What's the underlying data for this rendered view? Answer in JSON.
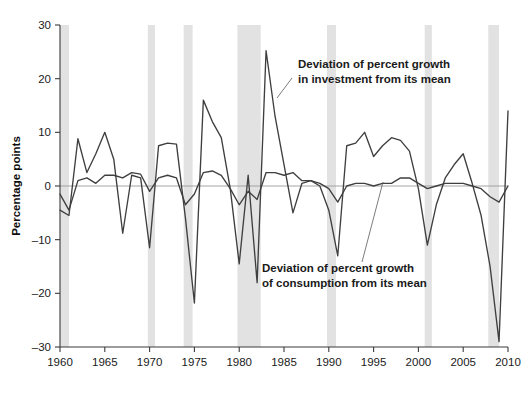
{
  "chart_data": {
    "type": "line",
    "title": "",
    "xlabel": "",
    "ylabel": "Percentage points",
    "xlim": [
      1960,
      2010
    ],
    "ylim": [
      -30,
      30
    ],
    "grid": false,
    "legend_position": "annotations-inline",
    "x_ticks": [
      1960,
      1965,
      1970,
      1975,
      1980,
      1985,
      1990,
      1995,
      2000,
      2005,
      2010
    ],
    "y_ticks": [
      -30,
      -20,
      -10,
      0,
      10,
      20,
      30
    ],
    "zero_line": 0,
    "x": [
      1960,
      1961,
      1962,
      1963,
      1964,
      1965,
      1966,
      1967,
      1968,
      1969,
      1970,
      1971,
      1972,
      1973,
      1974,
      1975,
      1976,
      1977,
      1978,
      1979,
      1980,
      1981,
      1982,
      1983,
      1984,
      1985,
      1986,
      1987,
      1988,
      1989,
      1990,
      1991,
      1992,
      1993,
      1994,
      1995,
      1996,
      1997,
      1998,
      1999,
      2000,
      2001,
      2002,
      2003,
      2004,
      2005,
      2006,
      2007,
      2008,
      2009,
      2010
    ],
    "series": [
      {
        "name": "Deviation of percent growth in investment from its mean",
        "values": [
          -4.5,
          -5.5,
          8.8,
          2.5,
          6.0,
          10.0,
          5.0,
          -8.8,
          2.0,
          1.5,
          -11.5,
          7.5,
          8.0,
          7.8,
          -6.0,
          -21.8,
          16.0,
          12.0,
          9.0,
          -0.5,
          -14.5,
          2.0,
          -18.0,
          25.2,
          13.0,
          4.0,
          -5.0,
          0.5,
          1.0,
          0.0,
          -4.5,
          -13.0,
          7.5,
          8.0,
          10.0,
          5.5,
          7.5,
          9.0,
          8.5,
          6.5,
          -0.5,
          -11.0,
          -3.5,
          1.5,
          4.0,
          6.0,
          0.5,
          -5.5,
          -15.0,
          -29.0,
          14.0
        ]
      },
      {
        "name": "Deviation of percent growth of consumption from its mean",
        "values": [
          -1.5,
          -4.5,
          1.0,
          1.5,
          0.5,
          2.0,
          2.0,
          1.5,
          2.5,
          2.2,
          -1.0,
          1.5,
          2.0,
          1.5,
          -3.5,
          -1.5,
          2.5,
          2.8,
          2.0,
          -0.5,
          -3.5,
          -1.0,
          -2.5,
          2.5,
          2.5,
          2.0,
          2.5,
          1.0,
          1.0,
          0.5,
          -0.5,
          -3.0,
          0.0,
          0.5,
          0.5,
          0.0,
          0.5,
          0.5,
          1.5,
          1.5,
          0.5,
          -0.5,
          0.0,
          0.5,
          0.5,
          0.5,
          0.0,
          -0.5,
          -2.0,
          -3.0,
          0.0
        ]
      }
    ],
    "shaded_bands": [
      {
        "name": "recession-1960",
        "start": 1960.0,
        "end": 1961.0
      },
      {
        "name": "recession-1970",
        "start": 1969.8,
        "end": 1970.6
      },
      {
        "name": "recession-1974",
        "start": 1973.8,
        "end": 1974.8
      },
      {
        "name": "recession-1980-82",
        "start": 1979.8,
        "end": 1982.4
      },
      {
        "name": "recession-1990",
        "start": 1989.8,
        "end": 1990.8
      },
      {
        "name": "recession-2001",
        "start": 2000.7,
        "end": 2001.5
      },
      {
        "name": "recession-2008",
        "start": 2007.8,
        "end": 2009.0
      }
    ],
    "annotations": [
      {
        "id": "investment-annotation",
        "line1": "Deviation of percent growth",
        "line2": "in investment from its mean",
        "text_x": 298,
        "text_y": 68,
        "leader": {
          "x1": 292,
          "y1": 78,
          "x2": 277,
          "y2": 98
        }
      },
      {
        "id": "consumption-annotation",
        "line1": "Deviation of percent growth",
        "line2": "of consumption from its mean",
        "text_x": 262,
        "text_y": 272,
        "leader": {
          "x1": 362,
          "y1": 262,
          "x2": 383,
          "y2": 182
        }
      }
    ],
    "colors": {
      "series_line": "#3f3f3f",
      "band": "#e2e2e2",
      "axis": "#3a3a3a",
      "zero_line": "#9a9a9a",
      "background": "#ffffff",
      "text": "#1a1a1a"
    }
  }
}
